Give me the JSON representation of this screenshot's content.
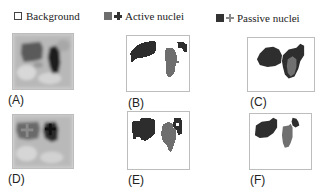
{
  "legend": {
    "items": [
      {
        "label": "Background",
        "icon": "empty-square-icon",
        "color": "#ffffff"
      },
      {
        "label": "Active nuclei",
        "icon": "square-plus-icon",
        "square_color": "#6e6e6e",
        "cross_color": "#333333"
      },
      {
        "label": "Passive nuclei",
        "icon": "square-plus-icon",
        "square_color": "#333333",
        "cross_color": "#7a7a7a"
      }
    ]
  },
  "panels": [
    {
      "label": "(A)",
      "type": "grayscale-image"
    },
    {
      "label": "(B)",
      "type": "segmentation"
    },
    {
      "label": "(C)",
      "type": "segmentation"
    },
    {
      "label": "(D)",
      "type": "grayscale-image-with-markers"
    },
    {
      "label": "(E)",
      "type": "segmentation"
    },
    {
      "label": "(F)",
      "type": "segmentation"
    }
  ],
  "colors": {
    "active": "#6e6e6e",
    "passive": "#333333",
    "panel_border": "#bdbdbd"
  }
}
